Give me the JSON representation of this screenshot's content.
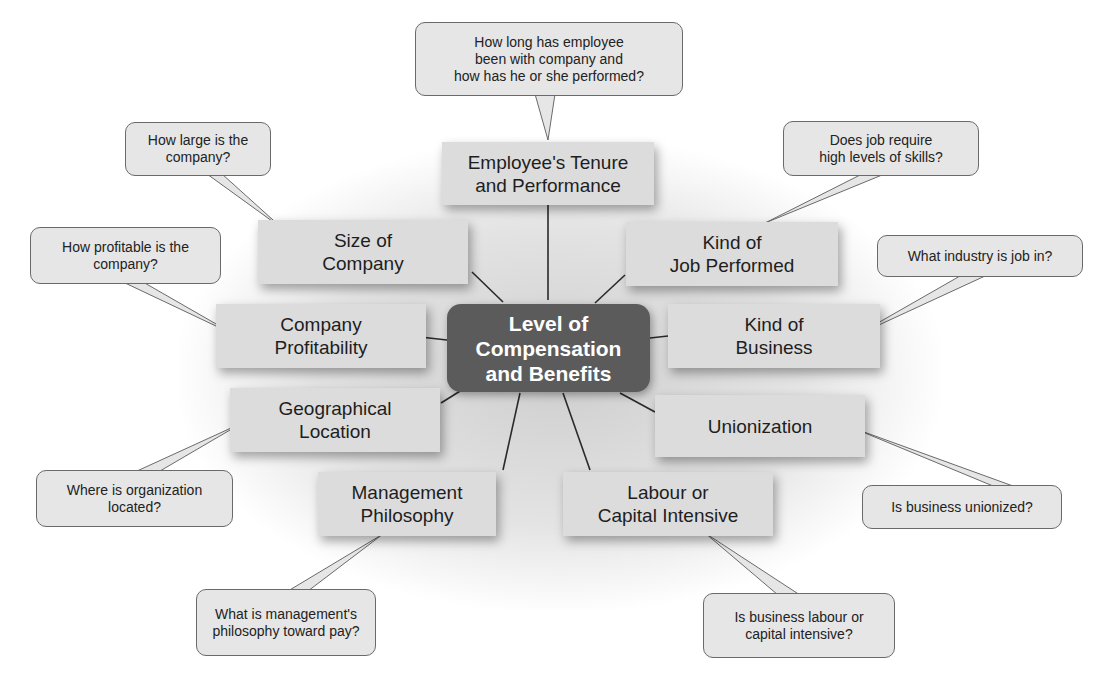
{
  "diagram": {
    "center": {
      "label": "Level of\nCompensation\nand Benefits"
    },
    "factors": [
      {
        "id": "tenure",
        "label": "Employee's Tenure\nand Performance",
        "question": "How long has employee\nbeen with company and\nhow has he or she performed?"
      },
      {
        "id": "size",
        "label": "Size of\nCompany",
        "question": "How large is the\ncompany?"
      },
      {
        "id": "profitability",
        "label": "Company\nProfitability",
        "question": "How profitable is the\ncompany?"
      },
      {
        "id": "location",
        "label": "Geographical\nLocation",
        "question": "Where is organization\nlocated?"
      },
      {
        "id": "management",
        "label": "Management\nPhilosophy",
        "question": "What is management's\nphilosophy toward pay?"
      },
      {
        "id": "labour",
        "label": "Labour or\nCapital Intensive",
        "question": "Is business labour or\ncapital intensive?"
      },
      {
        "id": "unionization",
        "label": "Unionization",
        "question": "Is business unionized?"
      },
      {
        "id": "business",
        "label": "Kind of\nBusiness",
        "question": "What industry is job in?"
      },
      {
        "id": "job",
        "label": "Kind of\nJob Performed",
        "question": "Does job require\nhigh levels of skills?"
      }
    ]
  }
}
